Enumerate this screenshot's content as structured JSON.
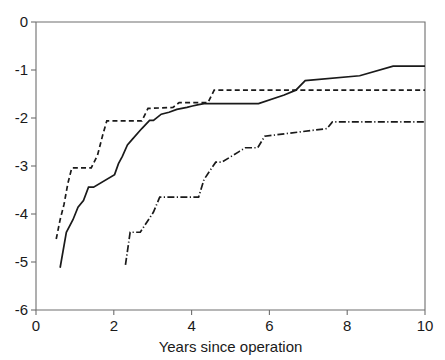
{
  "chart_data": {
    "type": "line",
    "subtype": "step",
    "title": "",
    "xlabel": "Years since operation",
    "ylabel": "",
    "xlim": [
      0,
      10
    ],
    "ylim": [
      -6,
      0
    ],
    "xticks": [
      0,
      2,
      4,
      6,
      8,
      10
    ],
    "xtick_labels": [
      "0",
      "2",
      "4",
      "6",
      "8",
      "10"
    ],
    "yticks": [
      0,
      -1,
      -2,
      -3,
      -4,
      -5,
      -6
    ],
    "ytick_labels": [
      "0",
      "-1",
      "-2",
      "-3",
      "-4",
      "-5",
      "-6"
    ],
    "grid": false,
    "legend": "none",
    "legend_entries": [],
    "series": [
      {
        "name": "solid-curve",
        "style": "solid",
        "color": "#1a1a1a",
        "x": [
          0.62,
          0.62,
          0.78,
          0.78,
          0.95,
          0.95,
          1.08,
          1.08,
          1.22,
          1.22,
          1.35,
          1.35,
          1.48,
          1.48,
          2.02,
          2.02,
          2.12,
          2.12,
          2.22,
          2.22,
          2.35,
          2.35,
          2.48,
          2.48,
          2.72,
          2.72,
          2.92,
          2.92,
          3.02,
          3.02,
          3.22,
          3.22,
          3.42,
          3.42,
          3.62,
          3.62,
          3.88,
          3.88,
          4.02,
          4.02,
          4.18,
          4.18,
          4.32,
          4.32,
          4.48,
          4.48,
          5.72,
          5.72,
          6.38,
          6.38,
          6.68,
          6.68,
          6.92,
          6.92,
          8.32,
          8.32,
          9.18,
          9.18,
          10.0
        ],
        "y": [
          -5.12,
          -5.12,
          -4.38,
          -4.38,
          -4.12,
          -4.12,
          -3.86,
          -3.86,
          -3.72,
          -3.72,
          -3.44,
          -3.44,
          -3.44,
          -3.44,
          -3.18,
          -3.18,
          -2.95,
          -2.95,
          -2.8,
          -2.8,
          -2.56,
          -2.56,
          -2.44,
          -2.44,
          -2.22,
          -2.22,
          -2.05,
          -2.05,
          -2.05,
          -2.05,
          -1.92,
          -1.92,
          -1.88,
          -1.88,
          -1.82,
          -1.82,
          -1.78,
          -1.78,
          -1.75,
          -1.75,
          -1.72,
          -1.72,
          -1.7,
          -1.7,
          -1.7,
          -1.7,
          -1.7,
          -1.7,
          -1.52,
          -1.52,
          -1.42,
          -1.42,
          -1.22,
          -1.22,
          -1.12,
          -1.12,
          -0.92,
          -0.92,
          -0.92
        ]
      },
      {
        "name": "dashed-curve",
        "style": "dashed",
        "color": "#1a1a1a",
        "x": [
          0.52,
          0.52,
          0.62,
          0.62,
          0.72,
          0.72,
          0.82,
          0.82,
          0.92,
          0.92,
          1.42,
          1.42,
          1.58,
          1.58,
          1.72,
          1.72,
          1.82,
          1.82,
          2.72,
          2.72,
          2.88,
          2.88,
          3.52,
          3.52,
          3.68,
          3.68,
          4.42,
          4.42,
          4.58,
          4.58,
          10.0
        ],
        "y": [
          -4.52,
          -4.52,
          -4.12,
          -4.12,
          -3.8,
          -3.8,
          -3.36,
          -3.36,
          -3.04,
          -3.04,
          -3.04,
          -3.04,
          -2.78,
          -2.78,
          -2.34,
          -2.34,
          -2.06,
          -2.06,
          -2.06,
          -2.06,
          -1.8,
          -1.8,
          -1.78,
          -1.78,
          -1.68,
          -1.68,
          -1.68,
          -1.68,
          -1.42,
          -1.42,
          -1.42
        ]
      },
      {
        "name": "dash-dot-curve",
        "style": "dashdot",
        "color": "#1a1a1a",
        "x": [
          2.3,
          2.3,
          2.42,
          2.42,
          2.68,
          2.68,
          3.02,
          3.02,
          3.18,
          3.18,
          4.18,
          4.18,
          4.32,
          4.32,
          4.62,
          4.62,
          4.78,
          4.78,
          5.22,
          5.22,
          5.38,
          5.38,
          5.7,
          5.7,
          5.88,
          5.88,
          7.48,
          7.48,
          7.62,
          7.62,
          10.0
        ],
        "y": [
          -5.06,
          -5.06,
          -4.38,
          -4.38,
          -4.38,
          -4.38,
          -3.96,
          -3.96,
          -3.65,
          -3.65,
          -3.65,
          -3.65,
          -3.28,
          -3.28,
          -2.92,
          -2.92,
          -2.92,
          -2.92,
          -2.7,
          -2.7,
          -2.62,
          -2.62,
          -2.62,
          -2.62,
          -2.38,
          -2.38,
          -2.22,
          -2.22,
          -2.08,
          -2.08,
          -2.08
        ]
      }
    ]
  }
}
